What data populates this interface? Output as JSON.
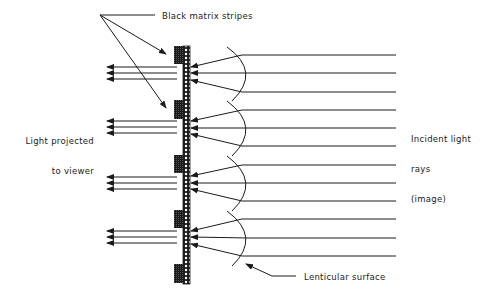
{
  "diagram": {
    "type": "lenticular rear-projection screen cross-section",
    "labels": {
      "black_matrix": "Black matrix stripes",
      "projected_line1": "Light projected",
      "projected_line2": "to viewer",
      "incident_line1": "Incident light",
      "incident_line2": "rays",
      "incident_line3": "(image)",
      "lenticular": "Lenticular surface"
    },
    "lens_count": 4,
    "black_matrix_stripe_count": 5,
    "incident_rays_per_lens": 3,
    "output_rays_per_lens": 3,
    "colors": {
      "line": "#1a1a1a",
      "background": "#ffffff"
    }
  }
}
